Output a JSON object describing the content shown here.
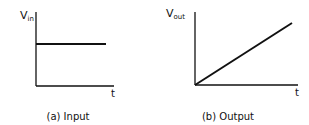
{
  "panels": [
    {
      "id": "a",
      "y_label": {
        "main": "V",
        "sub": "in"
      },
      "x_label": "t",
      "caption": "(a) Input",
      "signal": "constant"
    },
    {
      "id": "b",
      "y_label": {
        "main": "V",
        "sub": "out"
      },
      "x_label": "t",
      "caption": "(b) Output",
      "signal": "linear ramp from origin"
    }
  ],
  "colors": {
    "line": "#111111",
    "background": "#ffffff"
  }
}
